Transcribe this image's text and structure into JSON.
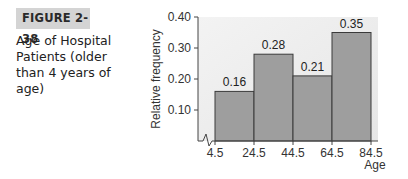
{
  "figure": {
    "label": "FIGURE 2-38",
    "caption": "Age of Hospital Patients (older than 4 years of age)"
  },
  "chart_data": {
    "type": "bar",
    "subtype": "histogram",
    "title": "Age of Hospital Patients (older than 4 years of age)",
    "xlabel": "Age",
    "ylabel": "Relative frequency",
    "class_boundaries": [
      4.5,
      24.5,
      44.5,
      64.5,
      84.5
    ],
    "categories": [
      "4.5–24.5",
      "24.5–44.5",
      "44.5–64.5",
      "64.5–84.5"
    ],
    "values": [
      0.16,
      0.28,
      0.21,
      0.35
    ],
    "data_labels": [
      "0.16",
      "0.28",
      "0.21",
      "0.35"
    ],
    "ylim": [
      0,
      0.4
    ],
    "yticks": [
      "0.10",
      "0.20",
      "0.30",
      "0.40"
    ],
    "xticks": [
      "4.5",
      "24.5",
      "44.5",
      "64.5",
      "84.5"
    ],
    "axis_break": true,
    "grid": false,
    "legend": null,
    "colors": {
      "bar": "#9e9e9e",
      "bar_edge": "#3a3a3a",
      "plot_background": "#ececec",
      "axis": "#444444"
    }
  }
}
